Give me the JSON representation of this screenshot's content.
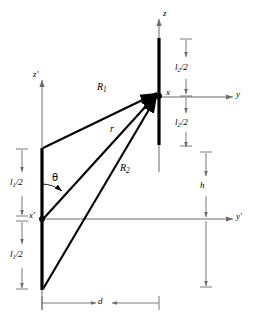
{
  "figure": {
    "type": "antenna-coupling-geometry-diagram",
    "background_color": "#ffffff",
    "line_color": "#000000",
    "axis_color": "#808080",
    "dimension_color": "#808080"
  },
  "axes": {
    "z": "z",
    "z_prime": "z′",
    "y": "y",
    "y_prime": "y′",
    "x": "x",
    "x_prime": "x′"
  },
  "rays": {
    "r1": {
      "symbol": "R",
      "subscript": "1"
    },
    "r": {
      "symbol": "r",
      "subscript": ""
    },
    "r2": {
      "symbol": "R",
      "subscript": "2"
    }
  },
  "angle": {
    "theta": "θ"
  },
  "dimensions": {
    "l1_upper": {
      "symbol": "l",
      "subscript": "1",
      "suffix": "/2"
    },
    "l1_lower": {
      "symbol": "l",
      "subscript": "1",
      "suffix": "/2"
    },
    "l2_upper": {
      "symbol": "l",
      "subscript": "2",
      "suffix": "/2"
    },
    "l2_lower": {
      "symbol": "l",
      "subscript": "2",
      "suffix": "/2"
    },
    "h": {
      "symbol": "h",
      "subscript": "",
      "suffix": ""
    },
    "d": {
      "symbol": "d",
      "subscript": "",
      "suffix": ""
    }
  },
  "geometry": {
    "left_dipole": {
      "x": 42,
      "top": 148,
      "bottom": 290,
      "center": 219
    },
    "right_dipole": {
      "x": 159,
      "top": 38,
      "bottom": 145,
      "center": 96
    },
    "separation_d": 117,
    "offset_h": 123
  }
}
